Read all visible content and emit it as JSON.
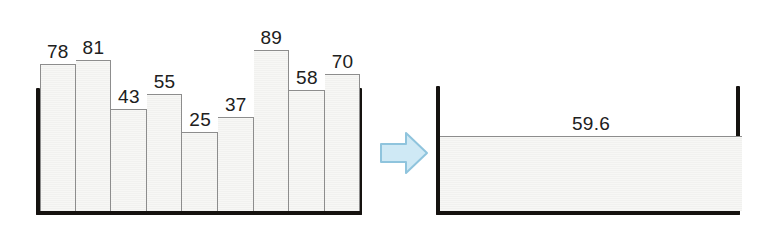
{
  "chart_data": {
    "type": "bar",
    "title": "",
    "subtitle": "",
    "xlabel": "",
    "ylabel": "",
    "grid": false,
    "legend": "none",
    "categories": [
      "1",
      "2",
      "3",
      "4",
      "5",
      "6",
      "7",
      "8",
      "9"
    ],
    "values": [
      78,
      81,
      43,
      55,
      25,
      37,
      89,
      58,
      70
    ],
    "data_labels": [
      "78",
      "81",
      "43",
      "55",
      "25",
      "37",
      "89",
      "58",
      "70"
    ],
    "ylim": [
      0,
      100
    ],
    "annotations": [
      {
        "name": "leveled-average",
        "label": "59.6",
        "value": 59.6,
        "type": "horizontal-level"
      }
    ],
    "transform": {
      "operator": "right-arrow",
      "meaning": "average / level out"
    },
    "panels": [
      {
        "name": "unequal-bars-panel",
        "type": "bar",
        "values": [
          78,
          81,
          43,
          55,
          25,
          37,
          89,
          58,
          70
        ]
      },
      {
        "name": "leveled-panel",
        "type": "area",
        "value": 59.6,
        "label": "59.6"
      }
    ]
  },
  "left_panel": {
    "name": "unequal-bars",
    "bars": [
      {
        "label": "78",
        "value": 78
      },
      {
        "label": "81",
        "value": 81
      },
      {
        "label": "43",
        "value": 43
      },
      {
        "label": "55",
        "value": 55
      },
      {
        "label": "25",
        "value": 25
      },
      {
        "label": "37",
        "value": 37
      },
      {
        "label": "89",
        "value": 89
      },
      {
        "label": "58",
        "value": 58
      },
      {
        "label": "70",
        "value": 70
      }
    ]
  },
  "arrow": {
    "name": "right-arrow",
    "direction": "right",
    "fill_color": "#cfe9f5",
    "stroke_color": "#8fc4dd"
  },
  "right_panel": {
    "name": "leveled-bar",
    "label": "59.6",
    "value": 59.6
  },
  "colors": {
    "bar_fill": "#f5f5f3",
    "bar_stroke": "#8d8d8d",
    "vessel": "#15120f",
    "text": "#202020",
    "background": "#ffffff"
  }
}
